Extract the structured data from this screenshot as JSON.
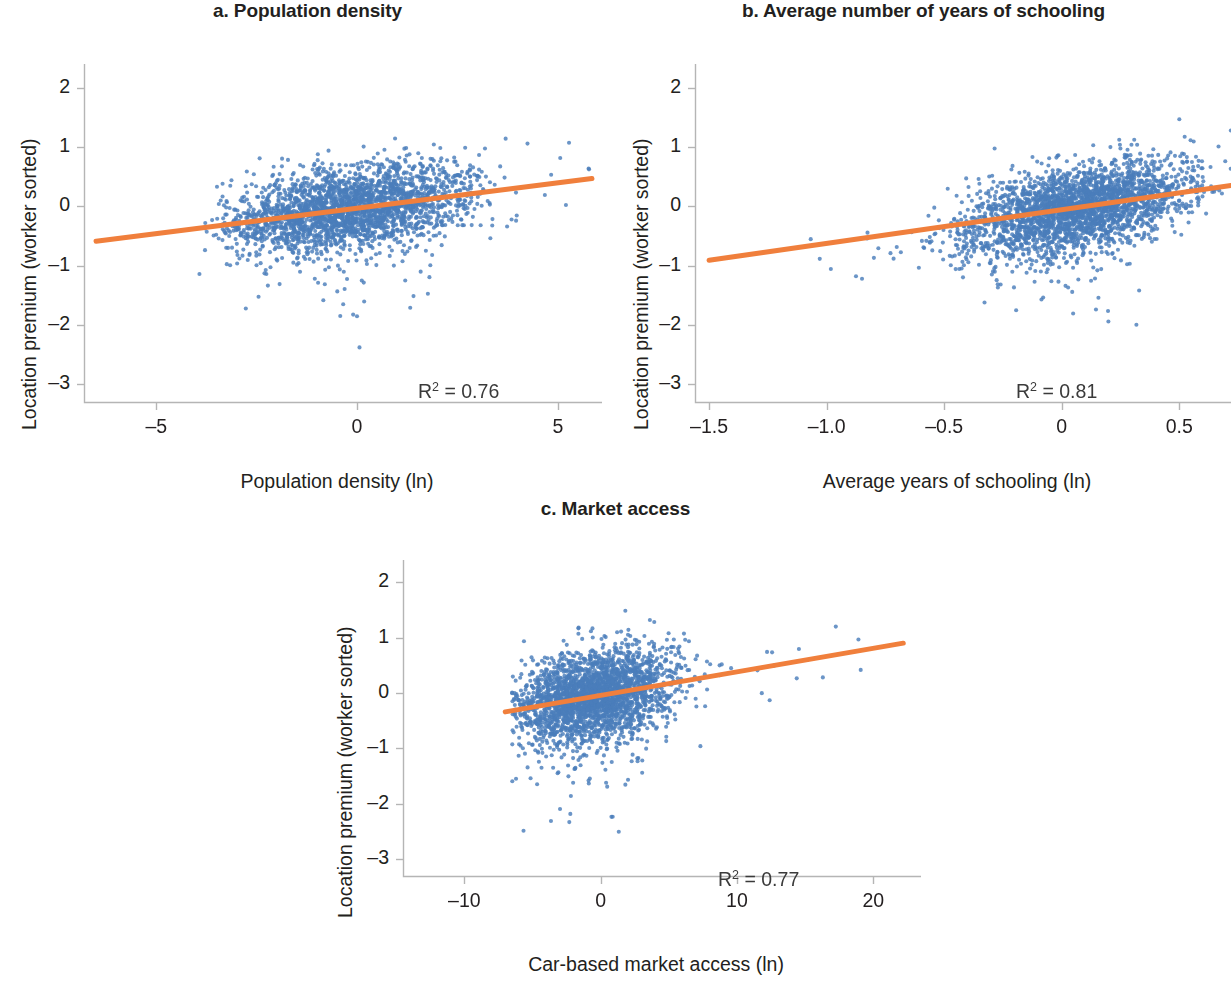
{
  "figure": {
    "background": "#ffffff",
    "point_color": "#4a7ebb",
    "line_color": "#f07f3c",
    "axis_color": "#b5b5b5",
    "text_color": "#231f20"
  },
  "panels": [
    {
      "id": "panel-a",
      "title": "a. Population density",
      "xlabel": "Population density (ln)",
      "ylabel": "Location premium (worker sorted)",
      "r2_prefix": "R",
      "r2_exp": "2",
      "r2_value": " = 0.76",
      "xticks": [
        "–5",
        "0",
        "5"
      ],
      "yticks": [
        "2",
        "1",
        "0",
        "–1",
        "–2",
        "–3"
      ]
    },
    {
      "id": "panel-b",
      "title": "b. Average number of years of schooling",
      "xlabel": "Average years of schooling (ln)",
      "ylabel": "Location premium (worker sorted)",
      "r2_prefix": "R",
      "r2_exp": "2",
      "r2_value": " = 0.81",
      "xticks": [
        "–1.5",
        "–1.0",
        "–0.5",
        "0",
        "0.5"
      ],
      "yticks": [
        "2",
        "1",
        "0",
        "–1",
        "–2",
        "–3"
      ]
    },
    {
      "id": "panel-c",
      "title": "c. Market access",
      "xlabel": "Car-based market access (ln)",
      "ylabel": "Location premium (worker sorted)",
      "r2_prefix": "R",
      "r2_exp": "2",
      "r2_value": " = 0.77",
      "xticks": [
        "–10",
        "0",
        "10",
        "20"
      ],
      "yticks": [
        "2",
        "1",
        "0",
        "–1",
        "–2",
        "–3"
      ]
    }
  ],
  "chart_data": [
    {
      "type": "scatter",
      "panel": "a",
      "title": "a. Population density",
      "xlabel": "Population density (ln)",
      "ylabel": "Location premium (worker sorted)",
      "xlim": [
        -6.8,
        6.1
      ],
      "ylim": [
        -3.3,
        2.4
      ],
      "xticks": [
        -5,
        0,
        5
      ],
      "yticks": [
        2,
        1,
        0,
        -1,
        -2,
        -3
      ],
      "grid": false,
      "legend": "none",
      "n_points": 2600,
      "cloud": {
        "x_mean": -0.2,
        "x_sd": 1.55,
        "y_mean": -0.05,
        "y_sd": 0.38,
        "correlation": 0.4,
        "x_min": -4.2,
        "x_max": 5.9,
        "y_min": -2.7,
        "y_max": 1.6,
        "skew_low_tail": 0.22
      },
      "fit_line": {
        "slope": 0.086,
        "intercept": -0.03,
        "x_start": -6.5,
        "x_end": 5.85,
        "y_start": -0.59,
        "y_end": 0.47,
        "r_squared": 0.76,
        "color": "#f07f3c",
        "width": 5
      },
      "annotation": {
        "text": "R2 = 0.76",
        "x": 3.2,
        "y": -2.6
      }
    },
    {
      "type": "scatter",
      "panel": "b",
      "title": "b. Average number of years of schooling",
      "xlabel": "Average years of schooling (ln)",
      "ylabel": "Location premium (worker sorted)",
      "xlim": [
        -1.56,
        0.72
      ],
      "ylim": [
        -3.3,
        2.4
      ],
      "xticks": [
        -1.5,
        -1.0,
        -0.5,
        0,
        0.5
      ],
      "yticks": [
        2,
        1,
        0,
        -1,
        -2,
        -3
      ],
      "grid": false,
      "legend": "none",
      "n_points": 2800,
      "cloud": {
        "x_mean": 0.06,
        "x_sd": 0.245,
        "y_mean": -0.03,
        "y_sd": 0.4,
        "correlation": 0.47,
        "x_min": -1.1,
        "x_max": 0.72,
        "y_min": -2.6,
        "y_max": 1.55,
        "skew_low_tail": 0.2
      },
      "fit_line": {
        "slope": 0.565,
        "intercept": -0.058,
        "x_start": -1.5,
        "x_end": 0.72,
        "y_start": -0.91,
        "y_end": 0.35,
        "r_squared": 0.81,
        "color": "#f07f3c",
        "width": 5
      },
      "annotation": {
        "text": "R2 = 0.81",
        "x": 0.33,
        "y": -2.6
      }
    },
    {
      "type": "scatter",
      "panel": "c",
      "title": "c. Market access",
      "xlabel": "Car-based market access (ln)",
      "ylabel": "Location premium (worker sorted)",
      "xlim": [
        -14.5,
        23.5
      ],
      "ylim": [
        -3.3,
        2.4
      ],
      "xticks": [
        -10,
        0,
        10,
        20
      ],
      "yticks": [
        2,
        1,
        0,
        -1,
        -2,
        -3
      ],
      "grid": false,
      "legend": "none",
      "n_points": 2700,
      "cloud": {
        "x_mean": -0.6,
        "x_sd": 3.0,
        "y_mean": -0.05,
        "y_sd": 0.42,
        "correlation": 0.33,
        "x_min": -6.5,
        "x_max": 22.0,
        "y_min": -2.6,
        "y_max": 1.5,
        "skew_low_tail": 0.26
      },
      "fit_line": {
        "slope": 0.0425,
        "intercept": -0.045,
        "x_start": -7.0,
        "x_end": 22.2,
        "y_start": -0.34,
        "y_end": 0.9,
        "r_squared": 0.77,
        "color": "#f07f3c",
        "width": 5
      },
      "annotation": {
        "text": "R2 = 0.77",
        "x": 13.0,
        "y": -2.62
      }
    }
  ]
}
